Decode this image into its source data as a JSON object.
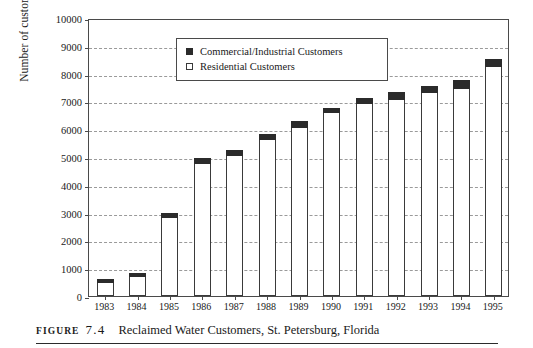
{
  "figure": {
    "label_word": "FIGURE",
    "number": "7.4",
    "caption": "Reclaimed Water Customers, St. Petersburg, Florida"
  },
  "legend": {
    "items": [
      {
        "label": "Commercial/Industrial Customers",
        "marker": "filled-square",
        "color": "#2b2b2b"
      },
      {
        "label": "Residential Customers",
        "marker": "hollow-square",
        "color": "#ffffff"
      }
    ]
  },
  "chart_data": {
    "type": "bar",
    "stacked": true,
    "title": "Reclaimed Water Customers, St. Petersburg, Florida",
    "xlabel": "",
    "ylabel": "Number of customers",
    "ylim": [
      0,
      10000
    ],
    "ytick_step": 1000,
    "yticks": [
      "0",
      "1000",
      "2000",
      "3000",
      "4000",
      "5000",
      "6000",
      "7000",
      "8000",
      "9000",
      "10000"
    ],
    "grid": true,
    "legend_position": "upper-center",
    "categories": [
      "1983",
      "1984",
      "1985",
      "1986",
      "1987",
      "1988",
      "1989",
      "1990",
      "1991",
      "1992",
      "1993",
      "1994",
      "1995"
    ],
    "series": [
      {
        "name": "Residential Customers",
        "color": "#ffffff",
        "values": [
          450,
          700,
          2820,
          4750,
          5050,
          5600,
          6050,
          6600,
          6900,
          7050,
          7300,
          7450,
          8250
        ]
      },
      {
        "name": "Commercial/Industrial Customers",
        "color": "#2b2b2b",
        "values": [
          150,
          120,
          180,
          200,
          220,
          220,
          230,
          180,
          220,
          280,
          250,
          330,
          280
        ]
      }
    ],
    "totals": [
      600,
      820,
      3000,
      4950,
      5270,
      5820,
      6280,
      6780,
      7120,
      7330,
      7550,
      7780,
      8530
    ]
  }
}
